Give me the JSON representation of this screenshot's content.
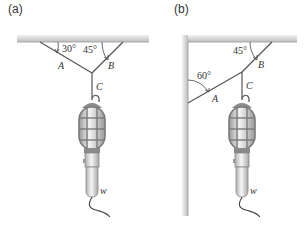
{
  "panels": [
    {
      "id": "a",
      "label": "(a)",
      "angles": {
        "A": "30°",
        "B": "45°"
      },
      "cables": {
        "A": "A",
        "B": "B",
        "C": "C"
      },
      "weight": "w"
    },
    {
      "id": "b",
      "label": "(b)",
      "angles": {
        "A": "60°",
        "B": "45°"
      },
      "cables": {
        "A": "A",
        "B": "B",
        "C": "C"
      },
      "weight": "w"
    }
  ],
  "colors": {
    "ceiling": "#c8c8c8",
    "line": "#555555",
    "lamp_cage": "#8a8a8a",
    "lamp_glass": "#e8e8e8"
  }
}
